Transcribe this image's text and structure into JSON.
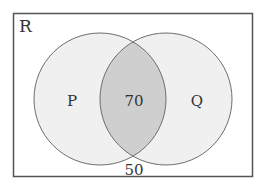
{
  "diagram": {
    "type": "venn",
    "universe": {
      "label": "R",
      "outside_value": "50"
    },
    "sets": [
      {
        "label": "P",
        "only_value": ""
      },
      {
        "label": "Q",
        "only_value": ""
      }
    ],
    "intersection": {
      "value": "70"
    },
    "colors": {
      "background": "#ffffff",
      "circle_fill": "#f0f0f0",
      "intersection_fill": "#cfcfcf",
      "stroke": "#6e6e6e",
      "frame_stroke": "#555555",
      "text": "#333333"
    }
  }
}
